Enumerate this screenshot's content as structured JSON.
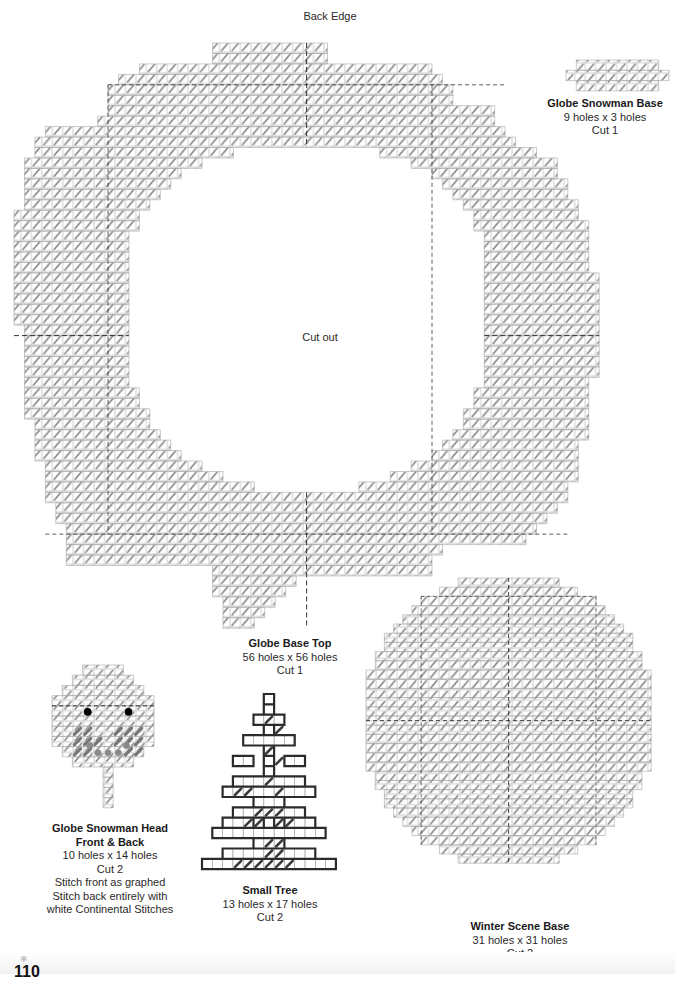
{
  "page": {
    "back_edge_label": "Back Edge",
    "cut_out_label": "Cut out",
    "page_number": "110",
    "snowflake_icon": "snowflake-icon"
  },
  "pieces": {
    "globe_snowman_base": {
      "title": "Globe Snowman Base",
      "size": "9 holes x 3 holes",
      "cut": "Cut 1"
    },
    "globe_base_top": {
      "title": "Globe Base Top",
      "size": "56 holes x 56 holes",
      "cut": "Cut 1"
    },
    "globe_snowman_head": {
      "title_line1": "Globe Snowman Head",
      "title_line2": "Front & Back",
      "size": "10 holes x 14 holes",
      "cut": "Cut 2",
      "note1": "Stitch front as graphed",
      "note2": "Stitch back entirely with",
      "note3": "white Continental Stitches"
    },
    "small_tree": {
      "title": "Small Tree",
      "size": "13 holes x 17 holes",
      "cut": "Cut 2"
    },
    "winter_scene_base": {
      "title": "Winter Scene Base",
      "size": "31 holes x 31 holes",
      "cut": "Cut 2"
    }
  },
  "colors": {
    "grid_line": "#b8b8b8",
    "outline": "#a8a8a8",
    "stitch": "#8c8c8c",
    "center_line": "#333333",
    "tree_outline": "#2b2b2b",
    "tree_stitch": "#3a3a3a",
    "cheek_stitch": "#777777",
    "eye": "#000000",
    "mouth_dot": "#8a8a8a"
  }
}
